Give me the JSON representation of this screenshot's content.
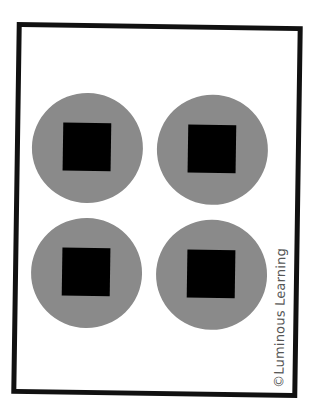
{
  "card": {
    "border_color": "#111111",
    "circle_color": "#8a8a8a",
    "square_color": "#000000",
    "items": [
      {
        "shape": "circle-with-square",
        "row": 1,
        "col": 1
      },
      {
        "shape": "circle-with-square",
        "row": 1,
        "col": 2
      },
      {
        "shape": "circle-with-square",
        "row": 2,
        "col": 1
      },
      {
        "shape": "circle-with-square",
        "row": 2,
        "col": 2
      }
    ],
    "count": 4,
    "credit": "©Luminous Learning"
  }
}
